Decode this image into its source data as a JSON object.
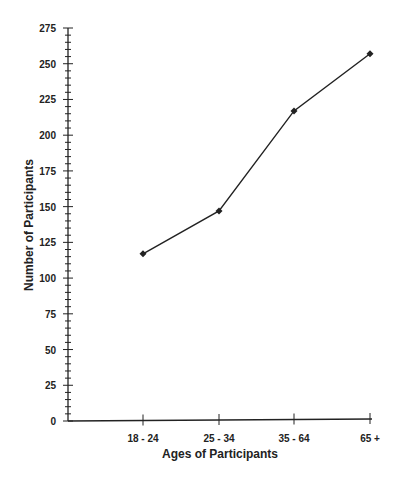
{
  "chart_data": {
    "type": "line",
    "title": "",
    "xlabel": "Ages of Participants",
    "ylabel": "Number of Participants",
    "categories": [
      "18 - 24",
      "25 - 34",
      "35 - 64",
      "65 +"
    ],
    "values": [
      117,
      147,
      217,
      257
    ],
    "ylim": [
      0,
      275
    ],
    "yticks": [
      0,
      25,
      50,
      75,
      100,
      125,
      150,
      175,
      200,
      225,
      250,
      275
    ],
    "minor_tick_step": 5,
    "grid": false,
    "legend": null,
    "marker": "diamond",
    "line_color": "#222222"
  }
}
